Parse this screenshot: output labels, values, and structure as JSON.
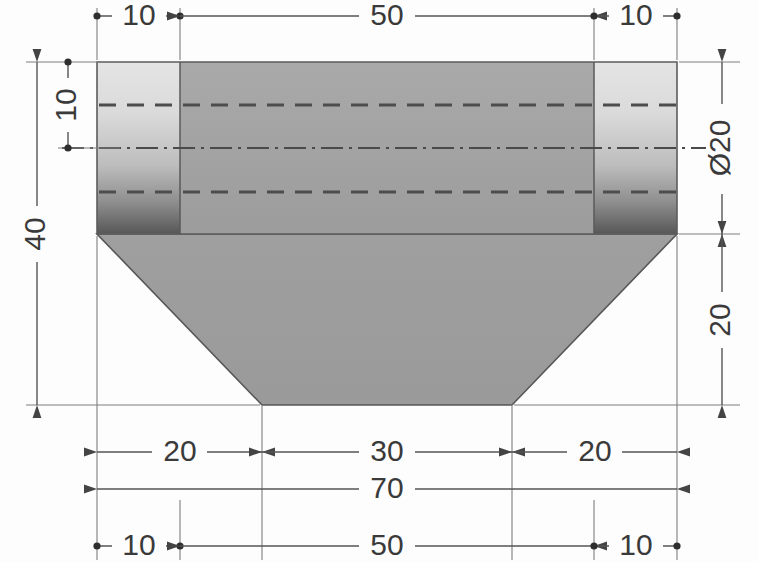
{
  "drawing": {
    "title": "Stepped shaft with chamfered base — front view",
    "view": "front-section",
    "units": "mm",
    "colors": {
      "paper": "#fdfdfd",
      "body_mid": "#a3a3a3",
      "flange_light": "#dcdcdc",
      "flange_dark": "#5f5f5f",
      "base_fill": "#9d9d9d",
      "outline": "#4a4a4a",
      "dim_line": "#555555",
      "text": "#3a3a3a",
      "hidden_line": "#4d4d4d"
    },
    "geometry": {
      "body_left_x": 97,
      "body_right_x": 677,
      "body_top_y": 62,
      "shaft_bottom_y": 234,
      "base_bottom_y": 405,
      "flange_left_inner_x": 180,
      "flange_right_inner_x": 594,
      "base_bottom_left_x": 262,
      "base_bottom_right_x": 512,
      "centerline_y": 148,
      "hidden_top_y": 105,
      "hidden_bottom_y": 192
    },
    "dimensions": {
      "top_row": [
        {
          "name": "top-left-10",
          "value": "10",
          "terminator": "dot",
          "x1": 97,
          "x2": 180,
          "y": 16
        },
        {
          "name": "top-center-50",
          "value": "50",
          "terminator": "arrow",
          "x1": 180,
          "x2": 594,
          "y": 16
        },
        {
          "name": "top-right-10",
          "value": "10",
          "terminator": "dot",
          "x1": 594,
          "x2": 677,
          "y": 16
        }
      ],
      "bottom_row_inner": [
        {
          "name": "bottom-left-20",
          "value": "20",
          "terminator": "arrow",
          "x1": 97,
          "x2": 262,
          "y": 452
        },
        {
          "name": "bottom-center-30",
          "value": "30",
          "terminator": "arrow",
          "x1": 262,
          "x2": 512,
          "y": 452
        },
        {
          "name": "bottom-right-20",
          "value": "20",
          "terminator": "arrow",
          "x1": 512,
          "x2": 677,
          "y": 452
        }
      ],
      "overall_width": {
        "name": "overall-70",
        "value": "70",
        "terminator": "arrow",
        "x1": 97,
        "x2": 677,
        "y": 489
      },
      "bottom_row_outer": [
        {
          "name": "bot-left-10",
          "value": "10",
          "terminator": "dot",
          "x1": 97,
          "x2": 180,
          "y": 546
        },
        {
          "name": "bot-center-50",
          "value": "50",
          "terminator": "arrow",
          "x1": 180,
          "x2": 594,
          "y": 546
        },
        {
          "name": "bot-right-10",
          "value": "10",
          "terminator": "dot",
          "x1": 594,
          "x2": 677,
          "y": 546
        }
      ],
      "left_column": [
        {
          "name": "left-overall-40",
          "value": "40",
          "terminator": "arrow",
          "y1": 62,
          "y2": 405,
          "x": 37
        },
        {
          "name": "left-bore-10",
          "value": "10",
          "terminator": "dot",
          "y1": 62,
          "y2": 148,
          "x": 68
        }
      ],
      "right_column": [
        {
          "name": "right-dia-20",
          "value": "Ø20",
          "terminator": "arrow",
          "y1": 62,
          "y2": 234,
          "x": 722
        },
        {
          "name": "right-base-20",
          "value": "20",
          "terminator": "arrow",
          "y1": 234,
          "y2": 405,
          "x": 722
        }
      ]
    }
  }
}
